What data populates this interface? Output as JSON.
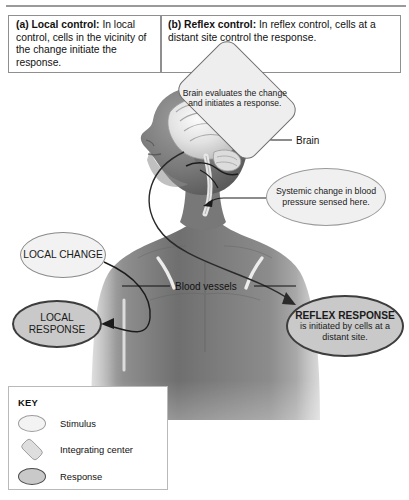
{
  "figure": {
    "panels": [
      {
        "id": "a",
        "tag": "(a) Local control:",
        "body": " In local control, cells in the vicinity of the change initiate the response."
      },
      {
        "id": "b",
        "tag": "(b) Reflex control:",
        "body": " In reflex control, cells at a distant site control the response."
      }
    ],
    "callouts": {
      "brain_diamond": "Brain evaluates the change and initiates a response.",
      "systemic_oval": "Systemic change in blood pressure sensed here.",
      "local_change": "LOCAL CHANGE",
      "local_response": "LOCAL RESPONSE",
      "reflex_response_title": "REFLEX RESPONSE",
      "reflex_response_body": "is initiated by cells at a distant site."
    },
    "labels": {
      "brain": "Brain",
      "blood_vessels": "Blood vessels"
    },
    "key": {
      "title": "KEY",
      "items": [
        {
          "label": "Stimulus",
          "shape": "oval-light"
        },
        {
          "label": "Integrating center",
          "shape": "diamond"
        },
        {
          "label": "Response",
          "shape": "oval-dark"
        }
      ]
    },
    "colors": {
      "stimulus_fill": "#f2f2f2",
      "response_fill": "#c9c9c9",
      "integrating_fill": "#eeeeee",
      "border": "#8f8f8f",
      "text": "#111111"
    }
  }
}
